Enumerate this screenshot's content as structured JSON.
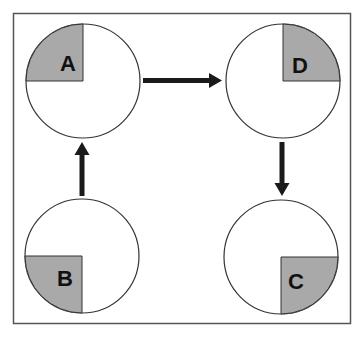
{
  "diagram": {
    "type": "cycle-flow",
    "frame_color": "#555555",
    "circle_stroke": "#333333",
    "quadrant_fill": "#a9a9a9",
    "arrow_color": "#1a1a1a",
    "nodes": [
      {
        "id": "A",
        "label": "A",
        "shaded_quadrant": "top-left"
      },
      {
        "id": "B",
        "label": "B",
        "shaded_quadrant": "bottom-left"
      },
      {
        "id": "C",
        "label": "C",
        "shaded_quadrant": "bottom-right"
      },
      {
        "id": "D",
        "label": "D",
        "shaded_quadrant": "top-right"
      }
    ],
    "edges": [
      {
        "from": "B",
        "to": "A"
      },
      {
        "from": "A",
        "to": "D"
      },
      {
        "from": "D",
        "to": "C"
      }
    ]
  }
}
